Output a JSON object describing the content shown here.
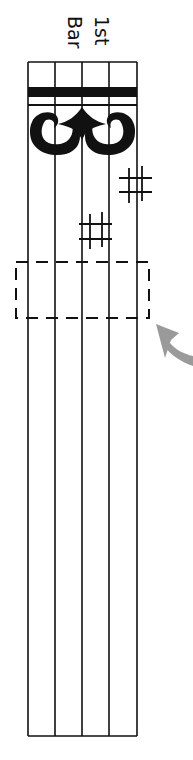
{
  "diagram": {
    "labels": {
      "line1": "1st",
      "line2": "Bar"
    },
    "staff": {
      "orientation": "vertical",
      "line_count": 5,
      "clef": "C clef (alto/tenor)",
      "key_signature": "2 sharps",
      "accidentals": [
        "sharp",
        "sharp"
      ]
    },
    "highlight": {
      "type": "dashed-box",
      "target": "first note position after key signature"
    },
    "pointer": {
      "type": "curved-arrow",
      "color": "#9a9a9a"
    },
    "colors": {
      "ink": "#111111",
      "arrow": "#9a9a9a",
      "background": "#ffffff"
    }
  }
}
